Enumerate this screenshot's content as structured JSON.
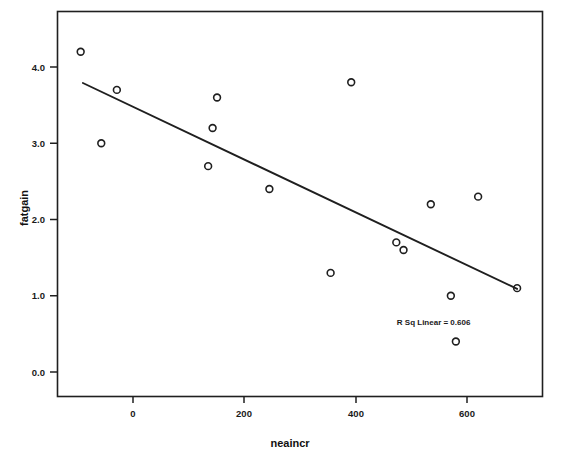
{
  "chart_data": {
    "type": "scatter",
    "title": "",
    "xlabel": "neaincr",
    "ylabel": "fatgain",
    "xlim": [
      -135,
      735
    ],
    "ylim": [
      -0.33,
      4.63
    ],
    "xticks": [
      0,
      200,
      400,
      600
    ],
    "xtick_labels": [
      "0",
      "200",
      "400",
      "600"
    ],
    "yticks": [
      0.0,
      1.0,
      2.0,
      3.0,
      4.0
    ],
    "ytick_labels": [
      "0.0",
      "1.0",
      "2.0",
      "3.0",
      "4.0"
    ],
    "grid": false,
    "legend": null,
    "marker": "open-circle",
    "points": [
      {
        "x": -94,
        "y": 4.2
      },
      {
        "x": -57,
        "y": 3.0
      },
      {
        "x": -29,
        "y": 3.7
      },
      {
        "x": 135,
        "y": 2.7
      },
      {
        "x": 143,
        "y": 3.2
      },
      {
        "x": 151,
        "y": 3.6
      },
      {
        "x": 245,
        "y": 2.4
      },
      {
        "x": 355,
        "y": 1.3
      },
      {
        "x": 392,
        "y": 3.8
      },
      {
        "x": 473,
        "y": 1.7
      },
      {
        "x": 486,
        "y": 1.6
      },
      {
        "x": 535,
        "y": 2.2
      },
      {
        "x": 571,
        "y": 1.0
      },
      {
        "x": 580,
        "y": 0.4
      },
      {
        "x": 620,
        "y": 2.3
      },
      {
        "x": 690,
        "y": 1.1
      }
    ],
    "fit_line": {
      "label": "linear-regression",
      "x1": -90,
      "y1": 3.79,
      "x2": 690,
      "y2": 1.09
    },
    "annotations": [
      {
        "name": "r-squared-annotation",
        "text": "R Sq Linear = 0.606",
        "x": 540,
        "y": 0.62
      }
    ]
  }
}
